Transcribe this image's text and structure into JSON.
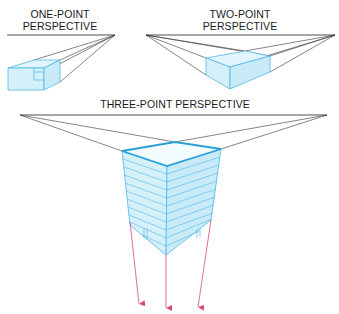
{
  "diagram": {
    "colors": {
      "horizon_line": "#222222",
      "box_stroke": "#4db8e8",
      "box_fill": "#d6f0fa",
      "box_top_stroke": "#2a9fd8",
      "vertical_vp_lines": "#d9477a"
    },
    "panels": [
      {
        "id": "one-point",
        "label_line1": "ONE-POINT",
        "label_line2": "PERSPECTIVE",
        "vanishing_points": 1
      },
      {
        "id": "two-point",
        "label_line1": "TWO-POINT",
        "label_line2": "PERSPECTIVE",
        "vanishing_points": 2
      },
      {
        "id": "three-point",
        "label_line1": "THREE-POINT PERSPECTIVE",
        "vanishing_points": 3
      }
    ]
  }
}
